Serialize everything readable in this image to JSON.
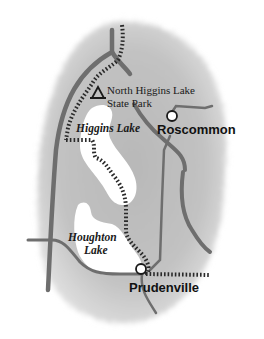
{
  "map": {
    "colors": {
      "land": "#bdbdbd",
      "road": "#6e6e6e",
      "water": "#ffffff",
      "trail": "#2a2a2a",
      "text": "#1a1a1a"
    },
    "labels": {
      "park_line1": "North  Higgins Lake",
      "park_line2": "State Park",
      "higgins_lake": "Higgins Lake",
      "roscommon": "Roscommon",
      "houghton_line1": "Houghton",
      "houghton_line2": "Lake",
      "prudenville": "Prudenville"
    },
    "symbols": {
      "park": "campground-triangle-icon",
      "town": "town-circle-icon"
    }
  }
}
